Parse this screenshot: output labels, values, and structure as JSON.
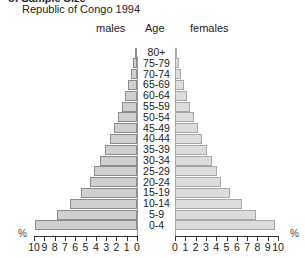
{
  "title_cut": "of Sample Size",
  "subtitle": "Republic of Congo 1994",
  "headers": {
    "males": "males",
    "age": "Age",
    "females": "females"
  },
  "axis_unit": "%",
  "chart_data": {
    "type": "bar",
    "orientation": "horizontal",
    "title": "Republic of Congo 1994",
    "xlabel": "%",
    "ylabel": "Age",
    "categories": [
      "80+",
      "75-79",
      "70-74",
      "65-69",
      "60-64",
      "55-59",
      "50-54",
      "45-49",
      "40-44",
      "35-39",
      "30-34",
      "25-29",
      "20-24",
      "15-19",
      "10-14",
      "5-9",
      "0-4"
    ],
    "series": [
      {
        "name": "males",
        "values": [
          0.2,
          0.4,
          0.6,
          0.9,
          1.2,
          1.5,
          1.8,
          2.2,
          2.6,
          3.1,
          3.6,
          4.2,
          4.6,
          5.4,
          6.5,
          7.8,
          9.9
        ]
      },
      {
        "name": "females",
        "values": [
          0.2,
          0.4,
          0.6,
          0.9,
          1.2,
          1.5,
          1.8,
          2.2,
          2.6,
          3.1,
          3.6,
          4.1,
          4.5,
          5.3,
          6.5,
          7.9,
          9.7
        ]
      }
    ],
    "xlim": [
      0,
      10
    ],
    "ticks": [
      "0",
      "1",
      "2",
      "3",
      "4",
      "5",
      "6",
      "7",
      "8",
      "9",
      "10"
    ],
    "grid": false,
    "legend": "none (side headers: males left, females right)"
  },
  "colors": {
    "male_bar": "#cfcfcf",
    "female_bar": "#dcdcdc",
    "bar_edge": "#8c8c8c"
  }
}
